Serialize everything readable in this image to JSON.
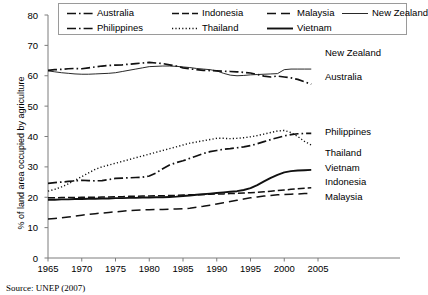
{
  "chart_data": {
    "type": "line",
    "title": "",
    "xlabel": "",
    "ylabel": "% of land area occupied by agriculture",
    "xlim": [
      1965,
      2005
    ],
    "ylim": [
      0,
      80
    ],
    "xticks": [
      "1965",
      "1970",
      "1975",
      "1980",
      "1985",
      "1990",
      "1995",
      "2000",
      "2005"
    ],
    "yticks": [
      "0",
      "10",
      "20",
      "30",
      "40",
      "50",
      "60",
      "70",
      "80"
    ],
    "grid": false,
    "legend_position": "top",
    "x": [
      1965,
      1966,
      1967,
      1968,
      1969,
      1970,
      1971,
      1972,
      1973,
      1974,
      1975,
      1976,
      1977,
      1978,
      1979,
      1980,
      1981,
      1982,
      1983,
      1984,
      1985,
      1986,
      1987,
      1988,
      1989,
      1990,
      1991,
      1992,
      1993,
      1994,
      1995,
      1996,
      1997,
      1998,
      1999,
      2000,
      2001,
      2002,
      2003,
      2004
    ],
    "series": [
      {
        "name": "Australia",
        "style": "dash-dot",
        "end_value": 57,
        "values": [
          61.8,
          62.0,
          62.1,
          62.3,
          62.4,
          62.3,
          62.6,
          62.9,
          63.2,
          63.4,
          63.5,
          63.6,
          63.8,
          64.0,
          64.2,
          64.4,
          64.2,
          64.0,
          63.6,
          63.2,
          62.6,
          62.3,
          62.0,
          61.8,
          61.7,
          61.6,
          61.5,
          61.4,
          61.3,
          61.1,
          60.9,
          60.4,
          59.9,
          59.6,
          59.9,
          59.6,
          59.3,
          58.8,
          58.0,
          57.2
        ]
      },
      {
        "name": "Indonesia",
        "style": "dash",
        "end_value": 23,
        "values": [
          19.8,
          19.8,
          19.9,
          19.9,
          19.9,
          20.0,
          20.0,
          20.0,
          20.1,
          20.1,
          20.2,
          20.2,
          20.3,
          20.3,
          20.4,
          20.4,
          20.5,
          20.5,
          20.6,
          20.6,
          20.7,
          20.8,
          20.8,
          20.9,
          21.0,
          21.1,
          21.1,
          21.2,
          21.3,
          21.4,
          21.5,
          21.6,
          21.8,
          22.0,
          22.2,
          22.4,
          22.6,
          22.8,
          23.0,
          23.1
        ]
      },
      {
        "name": "Malaysia",
        "style": "long-dash",
        "end_value": 21,
        "values": [
          12.8,
          13.0,
          13.2,
          13.5,
          13.8,
          14.1,
          14.4,
          14.6,
          14.8,
          15.0,
          15.2,
          15.4,
          15.6,
          15.7,
          15.8,
          15.9,
          16.0,
          16.0,
          16.1,
          16.1,
          16.2,
          16.4,
          16.7,
          17.0,
          17.4,
          17.8,
          18.2,
          18.6,
          19.0,
          19.4,
          19.8,
          20.1,
          20.4,
          20.6,
          20.8,
          20.9,
          21.0,
          21.1,
          21.2,
          21.2
        ]
      },
      {
        "name": "New Zealand",
        "style": "solid-thin",
        "end_value": 62,
        "values": [
          61.6,
          61.3,
          61.0,
          60.8,
          60.6,
          60.5,
          60.5,
          60.6,
          60.7,
          60.8,
          61.0,
          61.4,
          61.8,
          62.2,
          62.6,
          63.0,
          63.1,
          63.2,
          63.2,
          63.1,
          62.9,
          62.7,
          62.4,
          62.2,
          62.0,
          61.6,
          60.8,
          60.2,
          60.0,
          60.1,
          60.3,
          60.4,
          60.5,
          60.6,
          60.7,
          62.0,
          62.2,
          62.2,
          62.2,
          62.2
        ]
      },
      {
        "name": "Philippines",
        "style": "dash-dot",
        "end_value": 41,
        "values": [
          24.6,
          24.8,
          25.0,
          25.2,
          25.4,
          25.6,
          25.5,
          25.4,
          25.5,
          25.8,
          26.2,
          26.3,
          26.4,
          26.5,
          26.6,
          27.0,
          28.0,
          29.4,
          30.6,
          31.4,
          32.0,
          32.8,
          33.6,
          34.4,
          35.0,
          35.4,
          35.8,
          36.0,
          36.3,
          36.6,
          37.0,
          37.6,
          38.3,
          39.0,
          39.6,
          40.2,
          40.6,
          40.9,
          41.0,
          41.0
        ]
      },
      {
        "name": "Thailand",
        "style": "dotted",
        "end_value": 37,
        "values": [
          22.0,
          22.6,
          23.4,
          24.4,
          25.6,
          26.8,
          28.0,
          29.2,
          30.0,
          30.6,
          31.2,
          31.8,
          32.4,
          33.0,
          33.6,
          34.2,
          34.8,
          35.4,
          36.0,
          36.6,
          37.2,
          37.8,
          38.2,
          38.6,
          39.0,
          39.4,
          39.4,
          39.3,
          39.4,
          39.6,
          39.9,
          40.3,
          40.8,
          41.3,
          41.8,
          42.0,
          41.3,
          40.0,
          38.4,
          37.2
        ]
      },
      {
        "name": "Vietnam",
        "style": "solid-thick",
        "end_value": 29,
        "values": [
          19.2,
          19.2,
          19.3,
          19.3,
          19.4,
          19.4,
          19.5,
          19.5,
          19.6,
          19.6,
          19.7,
          19.7,
          19.8,
          19.8,
          19.9,
          19.9,
          20.0,
          20.0,
          20.1,
          20.2,
          20.4,
          20.6,
          20.8,
          21.0,
          21.2,
          21.4,
          21.6,
          21.8,
          22.0,
          22.4,
          23.0,
          24.0,
          25.2,
          26.4,
          27.4,
          28.2,
          28.6,
          28.8,
          28.9,
          29.0
        ]
      }
    ]
  },
  "legend": {
    "items": [
      {
        "label": "Australia",
        "style": "dash-dot"
      },
      {
        "label": "Indonesia",
        "style": "dash"
      },
      {
        "label": "Malaysia",
        "style": "long-dash"
      },
      {
        "label": "New Zealand",
        "style": "solid-thin"
      },
      {
        "label": "Philippines",
        "style": "dash-dot"
      },
      {
        "label": "Thailand",
        "style": "dotted"
      },
      {
        "label": "Vietnam",
        "style": "solid-thick"
      }
    ]
  },
  "right_labels": [
    {
      "label": "New Zealand",
      "top": 48
    },
    {
      "label": "Australia",
      "top": 72
    },
    {
      "label": "Philippines",
      "top": 127
    },
    {
      "label": "Thailand",
      "top": 148
    },
    {
      "label": "Vietnam",
      "top": 163
    },
    {
      "label": "Indonesia",
      "top": 177
    },
    {
      "label": "Malaysia",
      "top": 192
    }
  ],
  "source": "Source:  UNEP (2007)"
}
